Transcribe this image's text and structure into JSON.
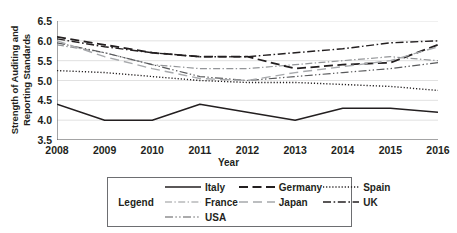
{
  "chart_data": {
    "type": "line",
    "title": "",
    "xlabel": "Year",
    "ylabel": "Strength of Auditing and\nReporting Standards",
    "x": [
      2008,
      2009,
      2010,
      2011,
      2012,
      2013,
      2014,
      2015,
      2016
    ],
    "xtick_labels": [
      "2008",
      "2009",
      "2010",
      "2011",
      "2012",
      "2013",
      "2014",
      "2015",
      "2016"
    ],
    "ytick_labels": [
      "6.5",
      "6.0",
      "5.5",
      "5.0",
      "4.5",
      "4.0",
      "3.5"
    ],
    "ylim": [
      3.5,
      6.5
    ],
    "xlim": [
      2008,
      2016
    ],
    "grid": "horizontal",
    "legend_position": "below",
    "legend_title": "Legend",
    "series": [
      {
        "name": "Italy",
        "style": "solid",
        "color": "#231f20",
        "width": 1.5,
        "values": [
          4.4,
          4.0,
          4.0,
          4.4,
          4.2,
          4.0,
          4.3,
          4.3,
          4.2
        ]
      },
      {
        "name": "France",
        "style": "dash-dot-light",
        "color": "#939598",
        "width": 1.2,
        "values": [
          5.9,
          5.7,
          5.4,
          5.3,
          5.3,
          5.4,
          5.5,
          5.6,
          5.5
        ]
      },
      {
        "name": "USA",
        "style": "dash-dot-dot",
        "color": "#58595b",
        "width": 1.2,
        "values": [
          5.95,
          5.7,
          5.4,
          5.1,
          5.0,
          5.1,
          5.2,
          5.3,
          5.45
        ]
      },
      {
        "name": "Germany",
        "style": "long-dash",
        "color": "#231f20",
        "width": 1.8,
        "values": [
          6.1,
          5.9,
          5.7,
          5.6,
          5.6,
          5.3,
          5.4,
          5.45,
          5.9
        ]
      },
      {
        "name": "Japan",
        "style": "long-dash-light",
        "color": "#a7a9ac",
        "width": 1.4,
        "values": [
          6.0,
          5.6,
          5.3,
          5.05,
          5.0,
          5.2,
          5.35,
          5.5,
          5.85
        ]
      },
      {
        "name": "Spain",
        "style": "dotted",
        "color": "#231f20",
        "width": 1.4,
        "values": [
          5.25,
          5.2,
          5.1,
          5.0,
          4.95,
          4.95,
          4.9,
          4.85,
          4.75
        ]
      },
      {
        "name": "UK",
        "style": "dash-dot",
        "color": "#231f20",
        "width": 1.4,
        "values": [
          6.05,
          5.85,
          5.7,
          5.6,
          5.6,
          5.7,
          5.8,
          5.95,
          6.0
        ]
      }
    ]
  },
  "legend": {
    "title": "Legend",
    "items": [
      {
        "label": "Italy"
      },
      {
        "label": "Germany"
      },
      {
        "label": "Spain"
      },
      {
        "label": "France"
      },
      {
        "label": "Japan"
      },
      {
        "label": "UK"
      },
      {
        "label": "USA"
      }
    ]
  }
}
